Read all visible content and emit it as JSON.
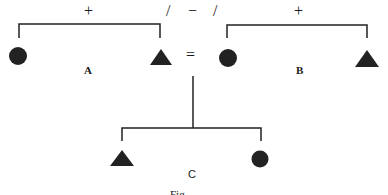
{
  "diagram": {
    "top_operators": {
      "left_plus": "+",
      "slash_left": "/",
      "minus": "−",
      "slash_right": "/",
      "right_plus": "+"
    },
    "equals": "=",
    "groups": [
      {
        "label": "A",
        "left_shape": "circle",
        "right_shape": "triangle"
      },
      {
        "label": "B",
        "left_shape": "circle",
        "right_shape": "triangle"
      },
      {
        "label": "C",
        "left_shape": "triangle",
        "right_shape": "circle"
      }
    ],
    "caption": "Fig."
  }
}
